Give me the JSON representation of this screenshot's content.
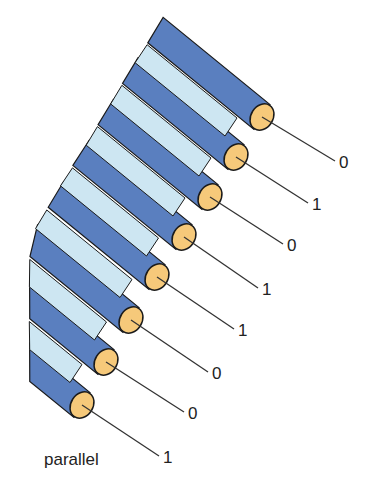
{
  "diagram": {
    "title": "parallel",
    "caption": "parallel",
    "colors": {
      "wire_dark": "#5a7fbf",
      "wire_light": "#cde6f2",
      "conductor": "#f6c97a",
      "outline": "#1a1a1a",
      "lead": "#333333"
    },
    "wires": [
      {
        "bit": "0",
        "end": [
          262,
          117
        ],
        "label_pos": [
          339,
          153
        ]
      },
      {
        "bit": "1",
        "end": [
          236,
          157
        ],
        "label_pos": [
          312,
          195
        ]
      },
      {
        "bit": "0",
        "end": [
          210,
          197
        ],
        "label_pos": [
          287,
          236
        ]
      },
      {
        "bit": "1",
        "end": [
          184,
          237
        ],
        "label_pos": [
          262,
          280
        ]
      },
      {
        "bit": "1",
        "end": [
          157,
          277
        ],
        "label_pos": [
          238,
          321
        ]
      },
      {
        "bit": "0",
        "end": [
          131,
          320
        ],
        "label_pos": [
          212,
          364
        ]
      },
      {
        "bit": "0",
        "end": [
          106,
          362
        ],
        "label_pos": [
          188,
          404
        ]
      },
      {
        "bit": "1",
        "end": [
          82,
          405
        ],
        "label_pos": [
          163,
          448
        ]
      }
    ]
  }
}
